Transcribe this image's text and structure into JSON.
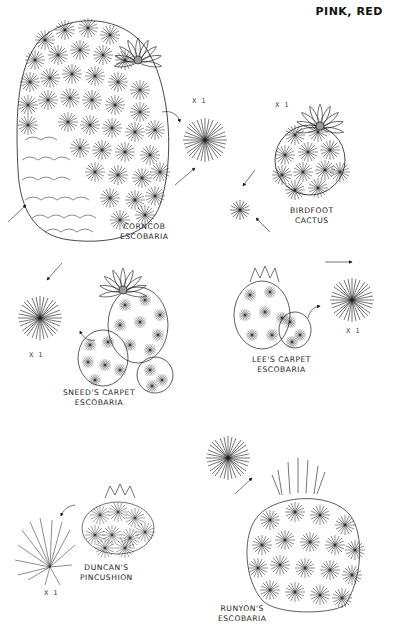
{
  "header": {
    "title": "PINK, RED"
  },
  "species": [
    {
      "id": "corncob",
      "name_line1": "CORNCOB",
      "name_line2": "ESCOBARIA",
      "scale": "X 1"
    },
    {
      "id": "birdfoot",
      "name_line1": "BIRDFOOT",
      "name_line2": "CACTUS",
      "scale": "X 1"
    },
    {
      "id": "sneeds",
      "name_line1": "SNEED'S CARPET",
      "name_line2": "ESCOBARIA",
      "scale": "X 1"
    },
    {
      "id": "lees",
      "name_line1": "LEE'S CARPET",
      "name_line2": "ESCOBARIA",
      "scale": "X 1"
    },
    {
      "id": "duncans",
      "name_line1": "DUNCAN'S",
      "name_line2": "PINCUSHION",
      "scale": "X 1"
    },
    {
      "id": "runyons",
      "name_line1": "RUNYON'S",
      "name_line2": "ESCOBARIA"
    }
  ],
  "colors": {
    "ink": "#1a1a1a",
    "paper": "#ffffff"
  }
}
